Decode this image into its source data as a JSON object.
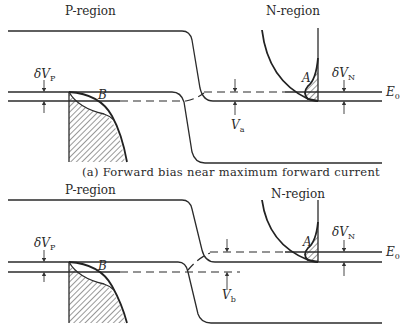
{
  "panels": [
    {
      "id": "a",
      "p_region_label": "P-region",
      "n_region_label": "N-region",
      "delta_vp": {
        "base": "δV",
        "sub": "P"
      },
      "delta_vn": {
        "base": "δV",
        "sub": "N"
      },
      "region_a_label": "A",
      "region_b_label": "B",
      "voltage_label": {
        "base": "V",
        "sub": "a"
      },
      "e0_label": {
        "base": "E",
        "sub": "0"
      },
      "caption": "(a)  Forward bias near maximum forward current"
    },
    {
      "id": "b",
      "p_region_label": "P-region",
      "n_region_label": "N-region",
      "delta_vp": {
        "base": "δV",
        "sub": "P"
      },
      "delta_vn": {
        "base": "δV",
        "sub": "N"
      },
      "region_a_label": "A",
      "region_b_label": "B",
      "voltage_label": {
        "base": "V",
        "sub": "b"
      },
      "e0_label": {
        "base": "E",
        "sub": "0"
      }
    }
  ],
  "colors": {
    "line": "#2b2b2b",
    "background": "#ffffff"
  }
}
